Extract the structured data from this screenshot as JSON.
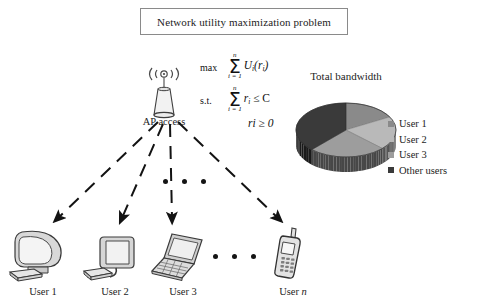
{
  "figure": {
    "title": "Network utility maximization problem",
    "ap": {
      "label": "AP access",
      "icon": "wireless-access-point-icon",
      "signal_glyph": "((∘))"
    },
    "optimization": {
      "objective_label": "max",
      "objective_sigma_top": "n",
      "objective_sigma_bottom": "i = 1",
      "objective_body": "U",
      "objective_body_sub": "i",
      "objective_body_arg": "(r",
      "objective_body_arg_sub": "i",
      "objective_body_arg_close": ")",
      "constraint_label": "s.t.",
      "constraint_sigma_top": "n",
      "constraint_sigma_bottom": "i = 1",
      "constraint_body": "r",
      "constraint_body_sub": "i",
      "constraint_rel": " ≤ C",
      "nonneg": "r",
      "nonneg_sub": "i",
      "nonneg_rel": " ≥ 0"
    },
    "pie": {
      "title": "Total bandwidth",
      "legend": [
        {
          "label": "User 1",
          "color": "#8a8a8a"
        },
        {
          "label": "User 2",
          "color": "#b9b9b9"
        },
        {
          "label": "User 3",
          "color": "#9d9d9d"
        },
        {
          "label": "Other users",
          "color": "#3a3a3a"
        }
      ]
    },
    "ellipsis_mid": [
      "•",
      "•",
      "•"
    ],
    "ellipsis_low": [
      "•",
      "•",
      "•"
    ],
    "devices": [
      {
        "label": "User 1",
        "icon": "crt-monitor-icon",
        "italic_suffix": ""
      },
      {
        "label": "User 2",
        "icon": "flat-monitor-icon",
        "italic_suffix": ""
      },
      {
        "label": "User 3",
        "icon": "laptop-icon",
        "italic_suffix": ""
      },
      {
        "label": "User ",
        "icon": "mobile-phone-icon",
        "italic_suffix": "n"
      }
    ]
  },
  "chart_data": {
    "type": "pie",
    "title": "Total bandwidth",
    "labels": [
      "User 1",
      "User 2",
      "User 3",
      "Other users"
    ],
    "values": [
      17,
      20,
      25,
      38
    ],
    "unit": "percent",
    "colors": [
      "#8a8a8a",
      "#b9b9b9",
      "#9d9d9d",
      "#3a3a3a"
    ],
    "legend_position": "right",
    "three_d": true,
    "grid": false
  }
}
